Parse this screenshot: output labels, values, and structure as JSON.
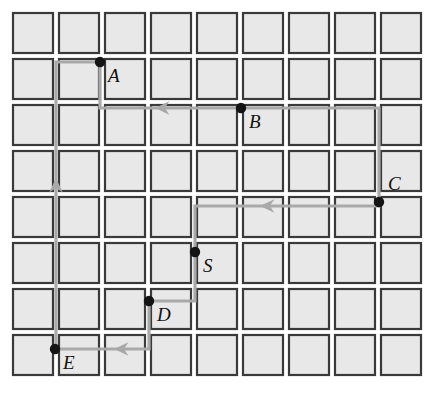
{
  "figure": {
    "type": "grid-graph-diagram",
    "width": 428,
    "height": 417,
    "background": "#ffffff"
  },
  "grid": {
    "columns": 9,
    "rows": 8,
    "origin_x": 13,
    "origin_y": 13,
    "cell_size": 40,
    "pitch_x": 46,
    "pitch_y": 46,
    "cell_fill": "#e8e8e8",
    "cell_stroke": "#3a3a3a"
  },
  "style": {
    "path_color": "#a9a9a9",
    "node_color": "#141414",
    "label_color": "#111111",
    "path_width": 3.2,
    "node_radius": 5.2
  },
  "nodes": [
    {
      "id": "A",
      "label": "A",
      "x": 100,
      "y": 62,
      "label_x": 108,
      "label_y": 66
    },
    {
      "id": "B",
      "label": "B",
      "x": 241,
      "y": 108,
      "label_x": 249,
      "label_y": 112
    },
    {
      "id": "C",
      "label": "C",
      "x": 379,
      "y": 202,
      "label_x": 388,
      "label_y": 174
    },
    {
      "id": "S",
      "label": "S",
      "x": 195,
      "y": 252,
      "label_x": 203,
      "label_y": 256
    },
    {
      "id": "D",
      "label": "D",
      "x": 149,
      "y": 301,
      "label_x": 157,
      "label_y": 305
    },
    {
      "id": "E",
      "label": "E",
      "x": 55,
      "y": 349,
      "label_x": 63,
      "label_y": 353
    }
  ],
  "edges": [
    {
      "id": "edge-A-B-C",
      "from": "A",
      "to": "C",
      "points": "100,62 100,108 241,108 379,108 379,202"
    },
    {
      "id": "edge-A-E",
      "from": "A",
      "to": "E",
      "points": "100,62 56,62 56,349 55,349"
    },
    {
      "id": "edge-S-D-E",
      "from": "S",
      "to": "E",
      "points": "195,252 195,301 149,301 149,349 55,349"
    },
    {
      "id": "edge-S-C",
      "from": "S",
      "to": "C",
      "points": "195,252 195,206 268,206 379,206 379,202"
    }
  ],
  "arrows": [
    {
      "id": "arrow-below-A",
      "x": 163,
      "y": 108,
      "direction": "left"
    },
    {
      "id": "arrow-left-col",
      "x": 56,
      "y": 186,
      "direction": "up"
    },
    {
      "id": "arrow-to-C",
      "x": 268,
      "y": 206,
      "direction": "left"
    },
    {
      "id": "arrow-to-E",
      "x": 122,
      "y": 349,
      "direction": "left"
    }
  ]
}
